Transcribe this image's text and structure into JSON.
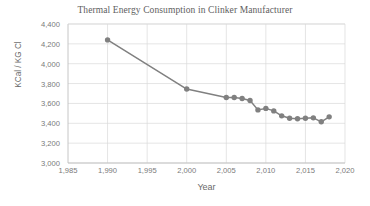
{
  "chart_data": {
    "type": "line",
    "title": "Thermal Energy Consumption in Clinker Manufacturer",
    "xlabel": "Year",
    "ylabel": "KCal / KG Cl",
    "xlim": [
      1985,
      2020
    ],
    "ylim": [
      3000,
      4400
    ],
    "xticks": [
      1985,
      1990,
      1995,
      2000,
      2005,
      2010,
      2015,
      2020
    ],
    "xtick_labels": [
      "1,985",
      "1,990",
      "1,995",
      "2,000",
      "2,005",
      "2,010",
      "2,015",
      "2,020"
    ],
    "yticks": [
      3000,
      3200,
      3400,
      3600,
      3800,
      4000,
      4200,
      4400
    ],
    "ytick_labels": [
      "3,000",
      "3,200",
      "3,400",
      "3,600",
      "3,800",
      "4,000",
      "4,200",
      "4,400"
    ],
    "grid": true,
    "legend": "none",
    "series": [
      {
        "name": "Thermal Energy Consumption",
        "color": "#808080",
        "marker": "circle",
        "x": [
          1990,
          2000,
          2005,
          2006,
          2007,
          2008,
          2009,
          2010,
          2011,
          2012,
          2013,
          2014,
          2015,
          2016,
          2017,
          2018
        ],
        "values": [
          4240,
          3745,
          3660,
          3660,
          3650,
          3630,
          3535,
          3550,
          3525,
          3475,
          3450,
          3445,
          3450,
          3455,
          3415,
          3465
        ]
      }
    ]
  },
  "axis_colors": {
    "grid": "#d9d9d9",
    "axis": "#bfbfbf",
    "text": "#7a7a7a",
    "series": "#808080"
  }
}
